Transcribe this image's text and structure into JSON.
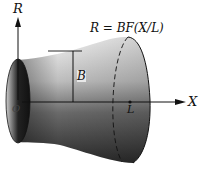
{
  "figure": {
    "title_formula": "R = BF(X/L)",
    "axis_labels": {
      "vertical": "R",
      "horizontal": "X"
    },
    "point_labels": {
      "origin": "O",
      "length": "L",
      "height": "B"
    },
    "colors": {
      "surface_dark": "#1a1a1a",
      "surface_mid": "#7a7a7a",
      "surface_light": "#e6e6e6",
      "line": "#111111",
      "background": "#ffffff"
    }
  }
}
